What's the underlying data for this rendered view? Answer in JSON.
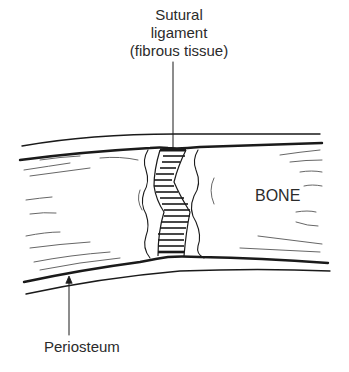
{
  "labels": {
    "sutural_line1": "Sutural",
    "sutural_line2": "ligament",
    "sutural_line3": "(fibrous tissue)",
    "bone": "BONE",
    "periosteum": "Periosteum"
  },
  "colors": {
    "ink": "#1a1a1a",
    "background": "#ffffff",
    "text": "#2b2b2b"
  }
}
